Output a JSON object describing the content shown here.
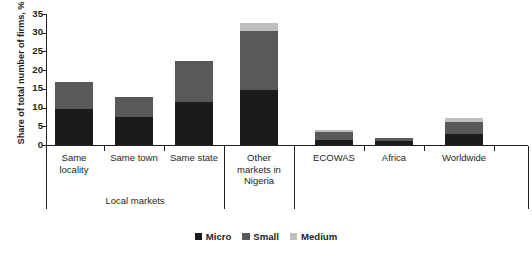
{
  "chart_data": {
    "type": "bar",
    "title": "",
    "xlabel": "",
    "ylabel": "Share of total number of firms, %",
    "ylim": [
      0,
      35
    ],
    "ytick_labels": [
      "0",
      "5",
      "10",
      "15",
      "20",
      "25",
      "30",
      "35"
    ],
    "ytick_values": [
      0,
      5,
      10,
      15,
      20,
      25,
      30,
      35
    ],
    "grid": false,
    "stacked": true,
    "legend_position": "bottom-center",
    "categories": [
      "Same locality",
      "Same town",
      "Same state",
      "Other markets in Nigeria",
      "ECOWAS",
      "Africa",
      "Worldwide"
    ],
    "category_lines": [
      [
        "Same",
        "locality"
      ],
      [
        "Same town"
      ],
      [
        "Same state"
      ],
      [
        "Other",
        "markets in",
        "Nigeria"
      ],
      [
        "ECOWAS"
      ],
      [
        "Africa"
      ],
      [
        "Worldwide"
      ]
    ],
    "series": [
      {
        "name": "Micro",
        "color": "#1b1b1b",
        "values": [
          9.7,
          7.4,
          11.4,
          14.8,
          1.3,
          1.0,
          2.9
        ]
      },
      {
        "name": "Small",
        "color": "#58595b",
        "values": [
          7.1,
          5.4,
          11.0,
          15.7,
          2.1,
          0.8,
          3.2
        ]
      },
      {
        "name": "Medium",
        "color": "#bcbec0",
        "values": [
          0.0,
          0.0,
          0.0,
          2.1,
          0.6,
          0.0,
          1.2
        ]
      }
    ],
    "totals": [
      16.8,
      12.8,
      22.4,
      32.6,
      4.0,
      1.8,
      7.3
    ],
    "groups": [
      {
        "label": "Local markets",
        "categories": [
          "Same locality",
          "Same town",
          "Same state"
        ]
      },
      {
        "label": "",
        "categories": [
          "Other markets in Nigeria"
        ]
      },
      {
        "label": "",
        "categories": [
          "ECOWAS",
          "Africa",
          "Worldwide"
        ]
      }
    ],
    "legend": [
      {
        "label": "Micro",
        "color": "#1b1b1b"
      },
      {
        "label": "Small",
        "color": "#58595b"
      },
      {
        "label": "Medium",
        "color": "#bcbec0"
      }
    ]
  }
}
